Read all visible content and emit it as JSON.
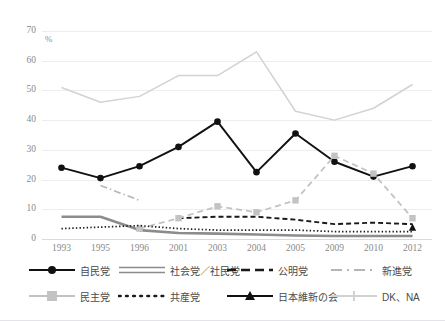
{
  "figure": {
    "clipped_title": "—— —— ——  ———— ——— ———",
    "unit_label": "%"
  },
  "chart_data": {
    "type": "line",
    "title": "",
    "subtitle": "",
    "xlabel": "",
    "ylabel": "%",
    "ylim": [
      0,
      70
    ],
    "ytick_step": 10,
    "yticks": [
      "0",
      "10",
      "20",
      "30",
      "40",
      "50",
      "60",
      "70"
    ],
    "grid": true,
    "legend_position": "bottom",
    "categories": [
      "1993",
      "1995",
      "1996",
      "2001",
      "2003",
      "2004",
      "2005",
      "2009",
      "2010",
      "2012"
    ],
    "series": [
      {
        "name": "自民党",
        "style": "solid-circle",
        "color": "#111111",
        "values": [
          24,
          20.5,
          24.5,
          31,
          39.5,
          22.5,
          35.5,
          26,
          21,
          24.5
        ]
      },
      {
        "name": "社会党／社民党",
        "style": "solid-thick-gray",
        "color": "#8c8c8c",
        "values": [
          7.5,
          7.5,
          3,
          2,
          1.8,
          1.5,
          1.2,
          1,
          1,
          1
        ]
      },
      {
        "name": "公明党",
        "style": "dashed-black",
        "color": "#1a1a1a",
        "values": [
          null,
          null,
          null,
          7,
          7.5,
          7.5,
          6.5,
          5,
          5.5,
          5
        ]
      },
      {
        "name": "新進党",
        "style": "dashdot-gray",
        "color": "#b5b5b5",
        "values": [
          null,
          18,
          13,
          null,
          null,
          null,
          null,
          null,
          null,
          null
        ]
      },
      {
        "name": "民主党",
        "style": "dashed-gray-square",
        "color": "#c3c3c3",
        "values": [
          null,
          null,
          3.5,
          7,
          11,
          9,
          13,
          28,
          22,
          7
        ]
      },
      {
        "name": "共産党",
        "style": "dotted-black",
        "color": "#1a1a1a",
        "values": [
          3.5,
          4,
          4.5,
          3.5,
          3,
          3,
          3,
          2.5,
          2.5,
          2.5
        ]
      },
      {
        "name": "日本維新の会",
        "style": "solid-triangle",
        "color": "#111111",
        "values": [
          null,
          null,
          null,
          null,
          null,
          null,
          null,
          null,
          null,
          4
        ]
      },
      {
        "name": "DK、NA",
        "style": "solid-gray-plus",
        "color": "#d2d2d2",
        "values": [
          51,
          46,
          48,
          55,
          55,
          63,
          43,
          40,
          44,
          52
        ]
      }
    ]
  },
  "legend": {
    "rows": [
      [
        {
          "label": "自民党",
          "swatch": "line-marker-circle-black"
        },
        {
          "label": "社会党／社民党",
          "swatch": "line-hollow-gray"
        },
        {
          "label": "公明党",
          "swatch": "line-dashed-black"
        },
        {
          "label": "新進党",
          "swatch": "line-dashdot-gray"
        }
      ],
      [
        {
          "label": "民主党",
          "swatch": "line-marker-square-gray"
        },
        {
          "label": "共産党",
          "swatch": "line-dotted-black"
        },
        {
          "label": "日本維新の会",
          "swatch": "line-marker-triangle-black"
        },
        {
          "label": "DK、NA",
          "swatch": "line-marker-plus-gray"
        }
      ]
    ]
  }
}
